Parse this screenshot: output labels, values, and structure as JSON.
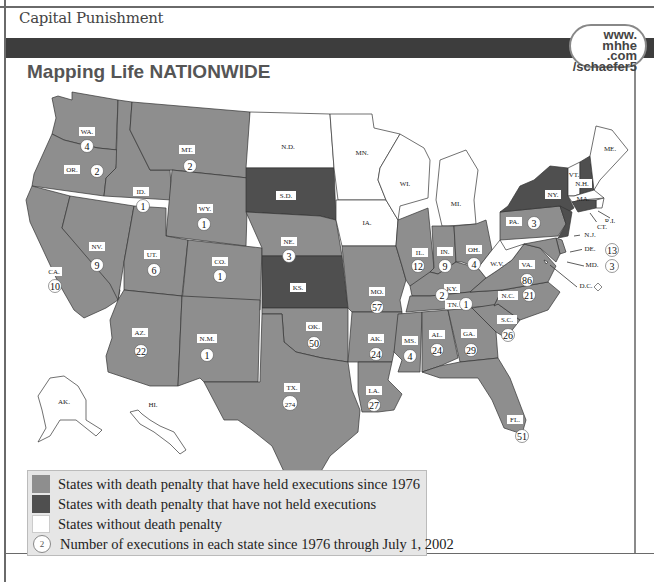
{
  "header": {
    "subtitle": "Capital Punishment",
    "url_badge": [
      "www.",
      "mhhe",
      ".com",
      "/schaefer5"
    ],
    "map_title": "Mapping Life NATIONWIDE"
  },
  "colors": {
    "executed": "#8e8e8e",
    "no_executions": "#4f4f4f",
    "no_death_penalty": "#ffffff",
    "border": "#333333",
    "band": "#3d3d3d"
  },
  "legend": {
    "items": [
      {
        "key": "executed",
        "label": "States with death penalty that have held executions since 1976"
      },
      {
        "key": "no_executions",
        "label": "States with death penalty that have not held executions"
      },
      {
        "key": "no_death_penalty",
        "label": "States without death penalty"
      },
      {
        "key": "count",
        "label": "Number of executions in each state since 1976 through July 1, 2002",
        "sample": "2"
      }
    ]
  },
  "states": [
    {
      "abbr": "WA.",
      "category": "executed",
      "executions": 4
    },
    {
      "abbr": "OR.",
      "category": "executed",
      "executions": 2
    },
    {
      "abbr": "CA.",
      "category": "executed",
      "executions": 10
    },
    {
      "abbr": "ID.",
      "category": "executed",
      "executions": 1
    },
    {
      "abbr": "NV.",
      "category": "executed",
      "executions": 9
    },
    {
      "abbr": "MT.",
      "category": "executed",
      "executions": 2
    },
    {
      "abbr": "WY.",
      "category": "executed",
      "executions": 1
    },
    {
      "abbr": "UT.",
      "category": "executed",
      "executions": 6
    },
    {
      "abbr": "CO.",
      "category": "executed",
      "executions": 1
    },
    {
      "abbr": "AZ.",
      "category": "executed",
      "executions": 22
    },
    {
      "abbr": "N.M.",
      "category": "executed",
      "executions": 1
    },
    {
      "abbr": "N.D.",
      "category": "no_death_penalty",
      "executions": null
    },
    {
      "abbr": "S.D.",
      "category": "no_executions",
      "executions": null
    },
    {
      "abbr": "NE.",
      "category": "executed",
      "executions": 3
    },
    {
      "abbr": "KS.",
      "category": "no_executions",
      "executions": null
    },
    {
      "abbr": "OK.",
      "category": "executed",
      "executions": 50
    },
    {
      "abbr": "TX.",
      "category": "executed",
      "executions": 274
    },
    {
      "abbr": "MN.",
      "category": "no_death_penalty",
      "executions": null
    },
    {
      "abbr": "IA.",
      "category": "no_death_penalty",
      "executions": null
    },
    {
      "abbr": "MO.",
      "category": "executed",
      "executions": 57
    },
    {
      "abbr": "AK.",
      "category": "executed",
      "executions": 24,
      "note": "Arkansas"
    },
    {
      "abbr": "LA.",
      "category": "executed",
      "executions": 27
    },
    {
      "abbr": "WI.",
      "category": "no_death_penalty",
      "executions": null
    },
    {
      "abbr": "IL.",
      "category": "executed",
      "executions": 12
    },
    {
      "abbr": "MI.",
      "category": "no_death_penalty",
      "executions": null
    },
    {
      "abbr": "IN.",
      "category": "executed",
      "executions": 9
    },
    {
      "abbr": "OH.",
      "category": "executed",
      "executions": 4
    },
    {
      "abbr": "KY.",
      "category": "executed",
      "executions": 2
    },
    {
      "abbr": "TN.",
      "category": "executed",
      "executions": 1
    },
    {
      "abbr": "MS.",
      "category": "executed",
      "executions": 4
    },
    {
      "abbr": "AL.",
      "category": "executed",
      "executions": 24
    },
    {
      "abbr": "GA.",
      "category": "executed",
      "executions": 29
    },
    {
      "abbr": "FL.",
      "category": "executed",
      "executions": 51
    },
    {
      "abbr": "S.C.",
      "category": "executed",
      "executions": 26
    },
    {
      "abbr": "N.C.",
      "category": "executed",
      "executions": 21
    },
    {
      "abbr": "VA.",
      "category": "executed",
      "executions": 86
    },
    {
      "abbr": "W.V.",
      "category": "no_death_penalty",
      "executions": null
    },
    {
      "abbr": "PA.",
      "category": "executed",
      "executions": 3
    },
    {
      "abbr": "NY.",
      "category": "no_executions",
      "executions": null
    },
    {
      "abbr": "VT.",
      "category": "no_death_penalty",
      "executions": null
    },
    {
      "abbr": "N.H.",
      "category": "no_executions",
      "executions": null
    },
    {
      "abbr": "ME.",
      "category": "no_death_penalty",
      "executions": null
    },
    {
      "abbr": "MA.",
      "category": "no_death_penalty",
      "executions": null
    },
    {
      "abbr": "R.I.",
      "category": "no_death_penalty",
      "executions": null
    },
    {
      "abbr": "CT.",
      "category": "no_executions",
      "executions": null
    },
    {
      "abbr": "N.J.",
      "category": "no_executions",
      "executions": null
    },
    {
      "abbr": "DE.",
      "category": "executed",
      "executions": 13
    },
    {
      "abbr": "MD.",
      "category": "executed",
      "executions": 3
    },
    {
      "abbr": "D.C.",
      "category": "no_death_penalty",
      "executions": null
    },
    {
      "abbr": "AK.",
      "category": "no_death_penalty",
      "executions": null,
      "note": "Alaska"
    },
    {
      "abbr": "HI.",
      "category": "no_death_penalty",
      "executions": null
    }
  ]
}
